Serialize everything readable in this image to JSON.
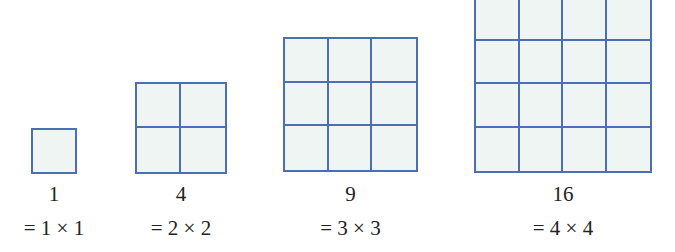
{
  "colors": {
    "grid_line": "#4a6fb5",
    "cell_fill": "#eef5f3",
    "text": "#222222"
  },
  "squares": [
    {
      "n": 1,
      "value_label": "1",
      "formula_label": "= 1 × 1",
      "cell_size": 44,
      "left": 31,
      "top": 128
    },
    {
      "n": 2,
      "value_label": "4",
      "formula_label": "= 2 × 2",
      "cell_size": 45,
      "left": 135,
      "top": 82
    },
    {
      "n": 3,
      "value_label": "9",
      "formula_label": "= 3 × 3",
      "cell_size": 44.3,
      "left": 283,
      "top": 37
    },
    {
      "n": 4,
      "value_label": "16",
      "formula_label": "= 4 × 4",
      "cell_size": 44,
      "left": 474,
      "top": -5
    }
  ]
}
